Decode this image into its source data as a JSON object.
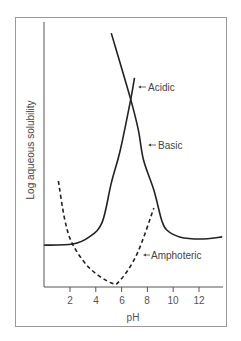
{
  "chart_data": {
    "type": "line",
    "title": "",
    "xlabel": "pH",
    "ylabel": "Log aqueous solubility",
    "xlim": [
      0,
      14
    ],
    "ylim": [
      0,
      100
    ],
    "x_ticks": [
      2,
      4,
      6,
      8,
      10,
      12
    ],
    "y_ticks": [],
    "grid": false,
    "legend": "none (inline arrow annotations)",
    "series": [
      {
        "name": "Acidic",
        "style": "solid",
        "color": "#222222",
        "points": [
          [
            0,
            15.8
          ],
          [
            2.2,
            16.2
          ],
          [
            3.5,
            18.9
          ],
          [
            4.5,
            24.5
          ],
          [
            5.2,
            39.2
          ],
          [
            5.9,
            51.7
          ],
          [
            6.7,
            70.6
          ],
          [
            7.0,
            78.9
          ]
        ]
      },
      {
        "name": "Basic",
        "style": "solid",
        "color": "#222222",
        "points": [
          [
            5.2,
            95.8
          ],
          [
            6.7,
            70.9
          ],
          [
            7.3,
            59.2
          ],
          [
            7.7,
            47.9
          ],
          [
            8.5,
            36.6
          ],
          [
            9.1,
            25.3
          ],
          [
            9.5,
            21.5
          ],
          [
            10.5,
            18.9
          ],
          [
            12.1,
            18.1
          ],
          [
            13.8,
            18.9
          ]
        ]
      },
      {
        "name": "Amphoteric",
        "style": "dashed",
        "color": "#222222",
        "points": [
          [
            1.1,
            40.0
          ],
          [
            1.6,
            25.3
          ],
          [
            2.2,
            16.2
          ],
          [
            3.5,
            7.2
          ],
          [
            5.2,
            1.5
          ],
          [
            5.9,
            2.6
          ],
          [
            7.2,
            12.5
          ],
          [
            8.5,
            29.8
          ]
        ]
      }
    ],
    "annotations": [
      {
        "text": "Acidic",
        "pointer": "arrow",
        "x": 7.3,
        "y": 75
      },
      {
        "text": "Basic",
        "pointer": "arrow",
        "x": 7.9,
        "y": 53
      },
      {
        "text": "Amphoteric",
        "pointer": "arrow",
        "x": 7.5,
        "y": 12
      }
    ]
  },
  "labels": {
    "xlabel": "pH",
    "ylabel": "Log aqueous solubility",
    "ticks": [
      "2",
      "4",
      "6",
      "8",
      "10",
      "12"
    ],
    "acidic": "Acidic",
    "basic": "Basic",
    "amphoteric": "Amphoteric"
  }
}
